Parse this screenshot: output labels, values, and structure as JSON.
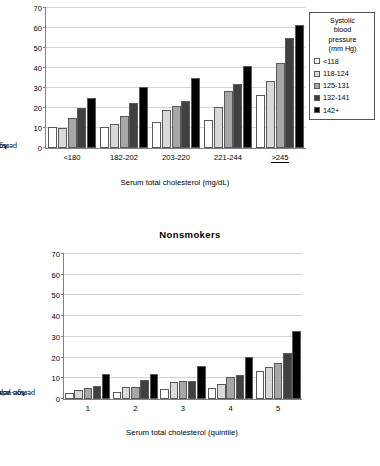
{
  "legend": {
    "title_lines": [
      "Systolic",
      "blood",
      "pressure",
      "(mm Hg)"
    ],
    "position": "top-right",
    "entries": [
      {
        "label": "<118",
        "color": "#ffffff"
      },
      {
        "label": "118-124",
        "color": "#d9d9d9"
      },
      {
        "label": "125-131",
        "color": "#a6a6a6"
      },
      {
        "label": "132-141",
        "color": "#404040"
      },
      {
        "label": "142+",
        "color": "#000000"
      }
    ]
  },
  "series_colors": [
    "#ffffff",
    "#d9d9d9",
    "#a6a6a6",
    "#404040",
    "#000000"
  ],
  "axis": {
    "ylabel_line1": "Age-adjusted CHD mortality/10,000",
    "ylabel_line2": "person years",
    "yticks": [
      0,
      10,
      20,
      30,
      40,
      50,
      60,
      70
    ]
  },
  "chart_data": [
    {
      "type": "bar",
      "title": "",
      "xlabel": "Serum total cholesterol (mg/dL)",
      "ylabel": "Age-adjusted CHD mortality/10,000 person years",
      "ylim": [
        0,
        70
      ],
      "yticks": [
        0,
        10,
        20,
        30,
        40,
        50,
        60,
        70
      ],
      "grid": true,
      "legend_position": "top-right",
      "categories": [
        "<180",
        "182-202",
        "203-220",
        "221-244",
        ">245"
      ],
      "series": [
        {
          "name": "<118",
          "values": [
            10.5,
            10.5,
            13.1,
            13.8,
            26.5
          ]
        },
        {
          "name": "118-124",
          "values": [
            9.9,
            11.8,
            19.0,
            20.4,
            33.6
          ]
        },
        {
          "name": "125-131",
          "values": [
            14.8,
            16.2,
            21.0,
            28.7,
            42.5
          ]
        },
        {
          "name": "132-141",
          "values": [
            19.9,
            22.7,
            23.5,
            32.0,
            55.0
          ]
        },
        {
          "name": "142+",
          "values": [
            25.2,
            30.3,
            35.2,
            41.0,
            61.4
          ]
        }
      ]
    },
    {
      "type": "bar",
      "title": "Nonsmokers",
      "xlabel": "Serum total cholesterol (quintile)",
      "ylabel": "Age-adjusted CHD mortality/10,000 person years",
      "ylim": [
        0,
        70
      ],
      "yticks": [
        0,
        10,
        20,
        30,
        40,
        50,
        60,
        70
      ],
      "grid": true,
      "legend_position": "none",
      "categories": [
        "1",
        "2",
        "3",
        "4",
        "5"
      ],
      "series": [
        {
          "name": "<118",
          "values": [
            2.9,
            3.4,
            5.0,
            5.3,
            13.3
          ]
        },
        {
          "name": "118-124",
          "values": [
            4.4,
            5.8,
            8.4,
            7.4,
            15.5
          ]
        },
        {
          "name": "125-131",
          "values": [
            5.2,
            5.9,
            8.5,
            10.4,
            17.4
          ]
        },
        {
          "name": "132-141",
          "values": [
            6.2,
            9.3,
            8.7,
            11.8,
            22.3
          ]
        },
        {
          "name": "142+",
          "values": [
            12.2,
            12.3,
            15.9,
            20.2,
            33.0
          ]
        }
      ]
    }
  ]
}
